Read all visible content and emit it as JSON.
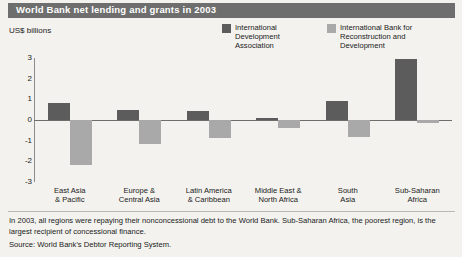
{
  "header": {
    "title": "World Bank net lending and grants in 2003"
  },
  "axis_units_label": "US$ billions",
  "legend": [
    {
      "label": "International Development Association",
      "color": "#5c5c5c",
      "key": "ida"
    },
    {
      "label": "International Bank for Reconstruction and Development",
      "color": "#a9a9a9",
      "key": "ibrd"
    }
  ],
  "footnote": "In 2003, all regions were repaying their nonconcessional debt to the World Bank. Sub-Saharan Africa, the poorest region, is the largest recipient of concessional finance.",
  "source": "Source: World Bank's Debtor Reporting System.",
  "chart_data": {
    "type": "bar",
    "title": "World Bank net lending and grants in 2003",
    "xlabel": "",
    "ylabel": "US$ billions",
    "ylim": [
      -3,
      3
    ],
    "yticks": [
      3,
      2,
      1,
      0,
      -1,
      -2,
      -3
    ],
    "grid": false,
    "legend_position": "top-right",
    "categories": [
      "East Asia & Pacific",
      "Europe & Central Asia",
      "Latin America & Caribbean",
      "Middle East & North Africa",
      "South Asia",
      "Sub-Saharan Africa"
    ],
    "series": [
      {
        "name": "International Development Association",
        "color": "#5c5c5c",
        "values": [
          0.8,
          0.5,
          0.45,
          0.1,
          0.9,
          2.95
        ]
      },
      {
        "name": "International Bank for Reconstruction and Development",
        "color": "#a9a9a9",
        "values": [
          -2.2,
          -1.15,
          -0.85,
          -0.4,
          -0.8,
          -0.15
        ]
      }
    ]
  }
}
